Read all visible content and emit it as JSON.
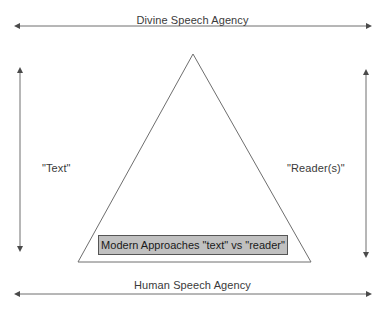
{
  "diagram": {
    "type": "triangle-axis-diagram",
    "background_color": "#ffffff",
    "stroke_color": "#6e6e6e",
    "text_color": "#3a3a3a",
    "top_axis": {
      "label": "Divine Speech Agency",
      "arrow_style": "double-headed",
      "orientation": "horizontal"
    },
    "bottom_axis": {
      "label": "Human Speech Agency",
      "arrow_style": "double-headed",
      "orientation": "horizontal"
    },
    "left_axis": {
      "label": "\"Text\"",
      "arrow_style": "double-headed",
      "orientation": "vertical"
    },
    "right_axis": {
      "label": "\"Reader(s)\"",
      "arrow_style": "double-headed",
      "orientation": "vertical"
    },
    "triangle": {
      "apex": "top-center",
      "fill": "none",
      "stroke": "#6e6e6e"
    },
    "callout_box": {
      "text": "Modern Approaches \"text\" vs \"reader\"",
      "fill_color": "#c0c0c0",
      "border_color": "#555555",
      "text_color": "#1a1a1a"
    }
  }
}
